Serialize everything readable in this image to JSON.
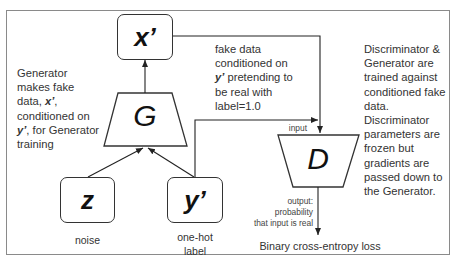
{
  "diagram": {
    "nodes": {
      "x_prime": {
        "label": "x’"
      },
      "generator": {
        "label": "G"
      },
      "noise": {
        "label": "z",
        "caption": "noise"
      },
      "y_prime": {
        "label": "y’",
        "caption_line1": "one-hot",
        "caption_line2": "label"
      },
      "discriminator": {
        "label": "D"
      }
    },
    "annotations": {
      "generator_note": {
        "line1": "Generator",
        "line2": "makes fake",
        "line3_pre": "data, ",
        "line3_var": "x’",
        "line3_post": ",",
        "line4": "conditioned on",
        "line5_var": "y’",
        "line5_post": ", for Generator",
        "line6": "training"
      },
      "fake_data_note": {
        "line1": "fake data",
        "line2": "conditioned on",
        "line3_var": "y’",
        "line3_post": " pretending to",
        "line4": "be real with",
        "line5": "label=1.0"
      },
      "discriminator_note": {
        "lines": [
          "Discriminator &",
          "Generator are",
          "trained against",
          "conditioned fake",
          "data.",
          "Discriminator",
          "parameters are",
          "frozen but",
          "gradients are",
          "passed down to",
          "the Generator."
        ]
      },
      "input_label": "input",
      "output_note": {
        "line1": "output:",
        "line2": "probability",
        "line3": "that input is real"
      },
      "loss_label": "Binary cross-entropy loss"
    },
    "edges": [
      {
        "from": "z",
        "to": "G"
      },
      {
        "from": "y’",
        "to": "G"
      },
      {
        "from": "G",
        "to": "x’"
      },
      {
        "from": "x’",
        "to": "D",
        "label": "input"
      },
      {
        "from": "y’",
        "to": "D",
        "label": "input"
      },
      {
        "from": "D",
        "to": "Binary cross-entropy loss"
      }
    ]
  }
}
